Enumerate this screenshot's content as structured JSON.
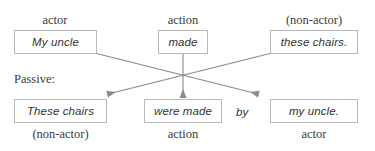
{
  "diagram": {
    "title_text": "Active to passive voice transformation diagram",
    "section_label": "Passive:",
    "connector_word": "by",
    "line_color": "#8a8a8a",
    "box_border_color": "#b9b9b9",
    "text_color": "#333333",
    "label_color": "#3b3b3b",
    "background_color": "#ffffff",
    "active_row": {
      "labels": [
        {
          "id": "actor-top",
          "text": "actor"
        },
        {
          "id": "action-top",
          "text": "action"
        },
        {
          "id": "non-actor-top",
          "text": "(non-actor)"
        }
      ],
      "boxes": [
        {
          "id": "subject-active",
          "text": "My uncle"
        },
        {
          "id": "verb-active",
          "text": "made"
        },
        {
          "id": "object-active",
          "text": "these chairs."
        }
      ]
    },
    "passive_row": {
      "boxes": [
        {
          "id": "subject-passive",
          "text": "These chairs"
        },
        {
          "id": "verb-passive",
          "text": "were made"
        },
        {
          "id": "agent-passive",
          "text": "my uncle."
        }
      ],
      "labels": [
        {
          "id": "non-actor-bottom",
          "text": "(non-actor)"
        },
        {
          "id": "action-bottom",
          "text": "action"
        },
        {
          "id": "actor-bottom",
          "text": "actor"
        }
      ]
    },
    "arrows": [
      {
        "id": "subject-to-agent",
        "from": "subject-active",
        "to": "agent-passive"
      },
      {
        "id": "verb-to-verb",
        "from": "verb-active",
        "to": "verb-passive"
      },
      {
        "id": "object-to-subject",
        "from": "object-active",
        "to": "subject-passive"
      }
    ]
  }
}
